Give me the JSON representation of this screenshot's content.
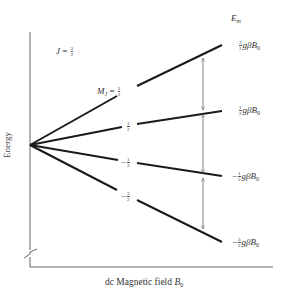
{
  "diagram": {
    "j_label": {
      "symbol": "J",
      "equals": "=",
      "num": "3",
      "den": "2"
    },
    "em_header": {
      "symbol": "E",
      "sub": "m"
    },
    "axes": {
      "y_label": "Energy",
      "x_label_text": "dc Magnetic field ",
      "x_label_symbol": "B",
      "x_label_sub": "0"
    },
    "levels": [
      {
        "mj_sign": "",
        "mj_num": "3",
        "mj_den": "2",
        "mj_prefix": "M",
        "mj_prefix_sub": "J",
        "energy_sign": "",
        "energy_num": "3",
        "energy_den": "2",
        "energy_rest": "gβB",
        "energy_sub": "0",
        "end_y": 45
      },
      {
        "mj_sign": "",
        "mj_num": "1",
        "mj_den": "2",
        "energy_sign": "",
        "energy_num": "1",
        "energy_den": "2",
        "energy_rest": "gβB",
        "energy_sub": "0",
        "end_y": 111
      },
      {
        "mj_sign": "−",
        "mj_num": "1",
        "mj_den": "2",
        "energy_sign": "−",
        "energy_num": "1",
        "energy_den": "2",
        "energy_rest": "gβB",
        "energy_sub": "0",
        "end_y": 176
      },
      {
        "mj_sign": "−",
        "mj_num": "3",
        "mj_den": "2",
        "energy_sign": "−",
        "energy_num": "3",
        "energy_den": "2",
        "energy_rest": "gβB",
        "energy_sub": "0",
        "end_y": 242
      }
    ],
    "transitions": [
      {
        "from": "3/2",
        "to": "1/2"
      },
      {
        "from": "1/2",
        "to": "-1/2"
      },
      {
        "from": "-1/2",
        "to": "-3/2"
      }
    ],
    "colors": {
      "line": "#1a1a1a",
      "axis": "#555555",
      "arrow": "#666666",
      "text": "#333333"
    }
  }
}
